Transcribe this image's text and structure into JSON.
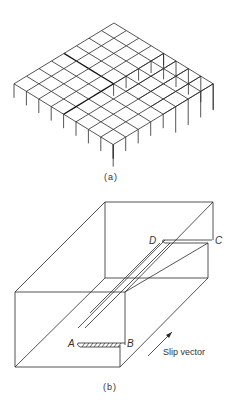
{
  "figure_a": {
    "caption": "(a)",
    "description": "Isometric lattice of cubes showing a screw dislocation step"
  },
  "figure_b": {
    "caption": "(b)",
    "labels": {
      "A": "A",
      "B": "B",
      "C": "C",
      "D": "D"
    },
    "slip_vector_label": "Slip vector"
  },
  "colors": {
    "line": "#2a2a2a",
    "background": "#ffffff"
  }
}
